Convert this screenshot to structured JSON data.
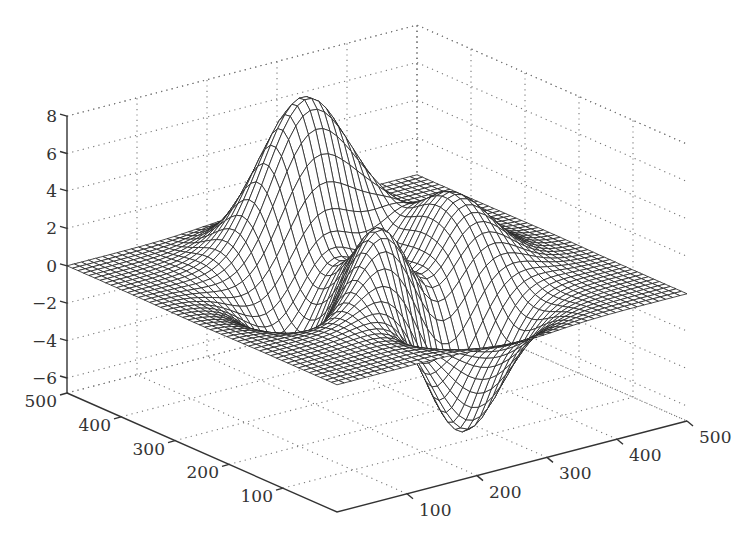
{
  "chart_data": {
    "type": "surface-mesh",
    "title": "",
    "function": "peaks",
    "xlabel": "",
    "ylabel": "",
    "zlabel": "",
    "x_range": [
      1,
      500
    ],
    "y_range": [
      1,
      500
    ],
    "zlim": [
      -6.8,
      8
    ],
    "grid": true,
    "x_ticks": [
      "100",
      "200",
      "300",
      "400",
      "500"
    ],
    "y_ticks": [
      "100",
      "200",
      "300",
      "400",
      "500"
    ],
    "z_ticks": [
      "8",
      "6",
      "4",
      "2",
      "0",
      "−2",
      "−4",
      "−6"
    ],
    "z_tick_values": [
      8,
      6,
      4,
      2,
      0,
      -2,
      -4,
      -6
    ],
    "xy_tick_values": [
      100,
      200,
      300,
      400,
      500
    ],
    "features": {
      "global_max": {
        "x": 250,
        "y": 382,
        "z": 8.1
      },
      "global_min": {
        "x": 269,
        "y": 114,
        "z": -6.55
      },
      "secondary_peak": {
        "x": 180,
        "y": 250,
        "z": 3.8
      },
      "secondary_bump": {
        "x": 380,
        "y": 330,
        "z": 3.6
      }
    },
    "mesh_lines": 49
  },
  "projection": {
    "origin": [
      337,
      512
    ],
    "x_unit": [
      0.7,
      -0.182
    ],
    "y_unit": [
      -0.54,
      -0.238
    ],
    "z_px_per_unit": 18.71,
    "z_min": -6.8
  },
  "colors": {
    "mesh": "#222222",
    "grid": "#777777",
    "axis": "#333333",
    "background": "#ffffff"
  }
}
